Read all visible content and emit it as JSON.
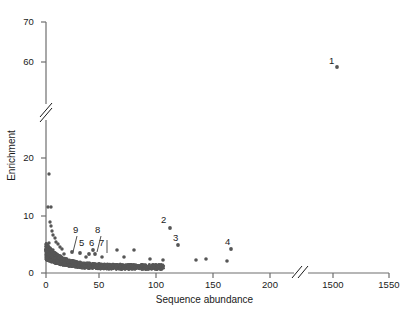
{
  "chart_data": {
    "type": "scatter",
    "title": "",
    "xlabel": "Sequence abundance",
    "ylabel": "Enrichment",
    "grid": false,
    "legend": null,
    "marker_color": "#565656",
    "axis_color": "#6e6e6e",
    "x_axis": {
      "ticks": [
        0,
        50,
        100,
        150,
        200,
        1500,
        1550
      ],
      "tick_labels": [
        "0",
        "50",
        "100",
        "150",
        "200",
        "1500",
        "1550"
      ],
      "break_between": [
        200,
        1500
      ],
      "has_break": true
    },
    "y_axis": {
      "ticks": [
        0,
        10,
        20,
        60,
        70
      ],
      "tick_labels": [
        "0",
        "10",
        "20",
        "60",
        "70"
      ],
      "break_between": [
        20,
        60
      ],
      "has_break": true
    },
    "annotations": [
      {
        "label": "1",
        "x": 1505,
        "y": 62
      },
      {
        "label": "2",
        "x": 110,
        "y": 7.3
      },
      {
        "label": "3",
        "x": 118,
        "y": 5.1
      },
      {
        "label": "4",
        "x": 165,
        "y": 4.5
      },
      {
        "label": "5",
        "x": 32,
        "y": 3.6
      },
      {
        "label": "6",
        "x": 40,
        "y": 3.4
      },
      {
        "label": "7",
        "x": 46,
        "y": 3.5
      },
      {
        "label": "8",
        "x": 44,
        "y": 4.2
      },
      {
        "label": "9",
        "x": 24,
        "y": 4.0
      }
    ],
    "labeled_points": [
      {
        "label": "1",
        "x": 1505,
        "y": 62
      },
      {
        "label": "2",
        "x": 110,
        "y": 7.3
      },
      {
        "label": "3",
        "x": 118,
        "y": 5.1
      },
      {
        "label": "4",
        "x": 165,
        "y": 4.5
      },
      {
        "label": "5",
        "x": 32,
        "y": 3.6
      },
      {
        "label": "6",
        "x": 40,
        "y": 3.4
      },
      {
        "label": "7",
        "x": 46,
        "y": 3.5
      },
      {
        "label": "8",
        "x": 44,
        "y": 4.2
      },
      {
        "label": "9",
        "x": 24,
        "y": 4.0
      }
    ],
    "notable_points": [
      {
        "x": 2,
        "y": 17.2
      },
      {
        "x": 1.5,
        "y": 11.5
      },
      {
        "x": 3.5,
        "y": 11.5
      },
      {
        "x": 4,
        "y": 8.9
      },
      {
        "x": 4.5,
        "y": 8.2
      },
      {
        "x": 5,
        "y": 7.4
      },
      {
        "x": 6,
        "y": 6.6
      },
      {
        "x": 7,
        "y": 6.2
      },
      {
        "x": 8.5,
        "y": 5.5
      },
      {
        "x": 10,
        "y": 5.1
      },
      {
        "x": 13,
        "y": 4.4
      },
      {
        "x": 66,
        "y": 4.0
      },
      {
        "x": 82,
        "y": 4.0
      },
      {
        "x": 127,
        "y": 2.4
      },
      {
        "x": 141,
        "y": 2.5
      },
      {
        "x": 171,
        "y": 2.1
      }
    ],
    "xlim": [
      0,
      1550
    ],
    "ylim": [
      0,
      70
    ]
  }
}
